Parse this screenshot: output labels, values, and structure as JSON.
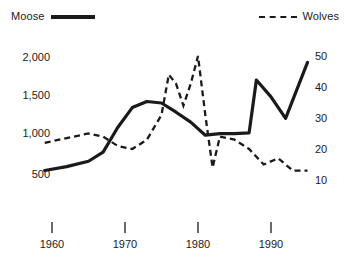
{
  "legend": {
    "moose": {
      "label": "Moose",
      "style": "solid-line",
      "color": "#1a1a1a"
    },
    "wolves": {
      "label": "Wolves",
      "style": "dashed-line",
      "color": "#1a1a1a"
    }
  },
  "axes": {
    "y_left": {
      "ticks": [
        "2,000",
        "1,500",
        "1,000",
        "500"
      ]
    },
    "y_right": {
      "ticks": [
        "50",
        "40",
        "30",
        "20",
        "10"
      ]
    },
    "x": {
      "ticks": [
        "1960",
        "1970",
        "1980",
        "1990"
      ]
    }
  },
  "chart_data": {
    "type": "line",
    "title": "",
    "subtitle": "",
    "xlabel": "",
    "ylabel": "",
    "grid": false,
    "legend_position": "top",
    "xlim": [
      1958,
      1996
    ],
    "x_ticks": [
      1960,
      1970,
      1980,
      1990
    ],
    "y_left": {
      "name": "Moose",
      "label": "Moose population",
      "lim": [
        0,
        2200
      ],
      "ticks": [
        500,
        1000,
        1500,
        2000
      ]
    },
    "y_right": {
      "name": "Wolves",
      "label": "Wolves population",
      "lim": [
        0,
        57
      ],
      "ticks": [
        10,
        20,
        30,
        40,
        50
      ]
    },
    "series": [
      {
        "name": "Moose",
        "axis": "left",
        "style": "solid",
        "color": "#1a1a1a",
        "x": [
          1959,
          1962,
          1965,
          1967,
          1969,
          1971,
          1973,
          1975,
          1977,
          1979,
          1981,
          1983,
          1985,
          1987,
          1988,
          1990,
          1992,
          1995
        ],
        "values": [
          520,
          570,
          640,
          760,
          1080,
          1340,
          1420,
          1400,
          1280,
          1150,
          980,
          1000,
          1000,
          1010,
          1700,
          1480,
          1200,
          1930
        ]
      },
      {
        "name": "Wolves",
        "axis": "right",
        "style": "dashed",
        "color": "#1a1a1a",
        "x": [
          1959,
          1961,
          1963,
          1965,
          1967,
          1969,
          1971,
          1973,
          1975,
          1976,
          1977,
          1978,
          1979,
          1980,
          1981,
          1982,
          1983,
          1985,
          1987,
          1989,
          1991,
          1993,
          1995
        ],
        "values": [
          22,
          23,
          24,
          25,
          24,
          21,
          20,
          23,
          31,
          44,
          41,
          34,
          41,
          50,
          31,
          14,
          24,
          23,
          20,
          15,
          17,
          13,
          13
        ]
      }
    ]
  }
}
